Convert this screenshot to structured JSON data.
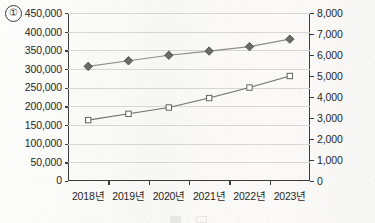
{
  "figure": {
    "index_marker": "①",
    "background": "#fbfbfa"
  },
  "chart_data": {
    "type": "line",
    "title": "",
    "subtitle": "",
    "xlabel": "",
    "ylabel": "",
    "grid": true,
    "legend_position": "bottom",
    "categories": [
      "2018년",
      "2019년",
      "2020년",
      "2021년",
      "2022년",
      "2023년"
    ],
    "axes": {
      "left": {
        "ticks": [
          "0",
          "50,000",
          "100,000",
          "150,000",
          "200,000",
          "250,000",
          "300,000",
          "350,000",
          "400,000",
          "450,000"
        ],
        "values": [
          0,
          50000,
          100000,
          150000,
          200000,
          250000,
          300000,
          350000,
          400000,
          450000
        ],
        "ylim": [
          0,
          450000
        ],
        "step": 50000
      },
      "right": {
        "ticks": [
          "0",
          "1,000",
          "2,000",
          "3,000",
          "4,000",
          "5,000",
          "6,000",
          "7,000",
          "8,000"
        ],
        "values": [
          0,
          1000,
          2000,
          3000,
          4000,
          5000,
          6000,
          7000,
          8000
        ],
        "ylim": [
          0,
          8000
        ],
        "step": 1000
      }
    },
    "series": [
      {
        "name": "",
        "axis": "left",
        "marker": "diamond-filled",
        "color": "#6b6b6b",
        "line_color": "#8d8d8d",
        "values": [
          307000,
          322000,
          337000,
          348000,
          360000,
          380000
        ]
      },
      {
        "name": "",
        "axis": "right",
        "marker": "square-open",
        "color": "#ffffff",
        "line_color": "#6e6e6e",
        "values": [
          2900,
          3200,
          3500,
          3950,
          4450,
          5000
        ]
      }
    ]
  },
  "legend": {
    "items": [
      {
        "label": "",
        "marker": "diamond-filled"
      },
      {
        "label": "",
        "marker": "square-open"
      }
    ]
  }
}
